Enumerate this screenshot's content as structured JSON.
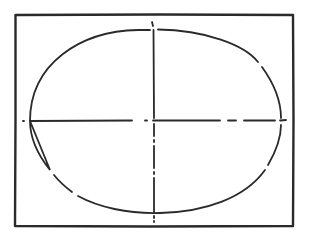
{
  "diagram": {
    "colors": {
      "background": "#ffffff",
      "stroke": "#2a2a2a"
    },
    "frame": {
      "x": 15,
      "y": 15,
      "width": 278,
      "height": 211
    },
    "ellipse": {
      "cx": 155,
      "cy": 120,
      "rx": 126,
      "ry": 92
    },
    "axes": {
      "horizontal": {
        "x1": 23,
        "y1": 121,
        "x2": 286,
        "y2": 120
      },
      "vertical": {
        "x1": 153,
        "y1": 22,
        "x2": 154,
        "y2": 222
      }
    }
  }
}
